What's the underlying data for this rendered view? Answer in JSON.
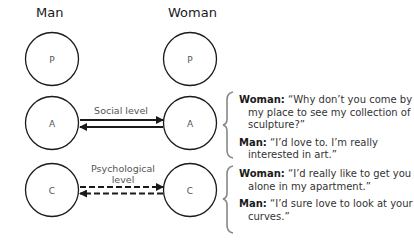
{
  "headers": {
    "left": "Man",
    "right": "Woman"
  },
  "circles": {
    "man": [
      "P",
      "A",
      "C"
    ],
    "woman": [
      "P",
      "A",
      "C"
    ]
  },
  "levels": {
    "social": "Social level",
    "psychological_line1": "Psychological",
    "psychological_line2": "level"
  },
  "dialogues": {
    "social": {
      "woman_speaker": "Woman:",
      "woman_text": "“Why don’t you come by my place to see my collection of sculpture?”",
      "man_speaker": "Man:",
      "man_text": "“I’d love to. I’m really interested in art.”"
    },
    "psychological": {
      "woman_speaker": "Woman:",
      "woman_text": "“I’d really like to get you alone in my apartment.”",
      "man_speaker": "Man:",
      "man_text": "“I’d sure love to look at your curves.”"
    }
  },
  "colors": {
    "stroke": "#1a1a1a",
    "brace": "#888888",
    "label": "#555555"
  }
}
